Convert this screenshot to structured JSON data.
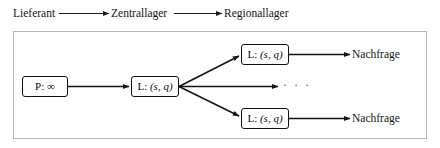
{
  "figure": {
    "type": "supply-chain-network-diagram",
    "language": "de"
  },
  "header": {
    "stages": [
      {
        "id": "supplier",
        "label": "Lieferant"
      },
      {
        "id": "central-warehouse",
        "label": "Zentrallager"
      },
      {
        "id": "regional-warehouse",
        "label": "Regionallager"
      }
    ],
    "connector": "arrow-right"
  },
  "diagram": {
    "nodes": [
      {
        "id": "supplier-node",
        "label": "P: ∞",
        "role": "supplier",
        "capacity": "∞",
        "prefix": "P"
      },
      {
        "id": "central-node",
        "label": "L: (s, q)",
        "role": "central-warehouse",
        "policy": "(s, q)",
        "prefix": "L"
      },
      {
        "id": "regional-node-top",
        "label": "L: (s, q)",
        "role": "regional-warehouse",
        "policy": "(s, q)",
        "prefix": "L"
      },
      {
        "id": "regional-node-bottom",
        "label": "L: (s, q)",
        "role": "regional-warehouse",
        "policy": "(s, q)",
        "prefix": "L"
      }
    ],
    "sinks": [
      {
        "id": "demand-top",
        "label": "Nachfrage"
      },
      {
        "id": "demand-bottom",
        "label": "Nachfrage"
      }
    ],
    "ellipsis": "· · ·",
    "edges": [
      {
        "from": "supplier-node",
        "to": "central-node"
      },
      {
        "from": "central-node",
        "to": "regional-node-top"
      },
      {
        "from": "central-node",
        "to": "ellipsis"
      },
      {
        "from": "central-node",
        "to": "regional-node-bottom"
      },
      {
        "from": "regional-node-top",
        "to": "demand-top"
      },
      {
        "from": "regional-node-bottom",
        "to": "demand-bottom"
      }
    ]
  },
  "colors": {
    "stroke": "#111111",
    "frame": "#b4b4b4",
    "text": "#131313",
    "background": "#ffffff",
    "ellipsis": "#4a4a4a"
  }
}
